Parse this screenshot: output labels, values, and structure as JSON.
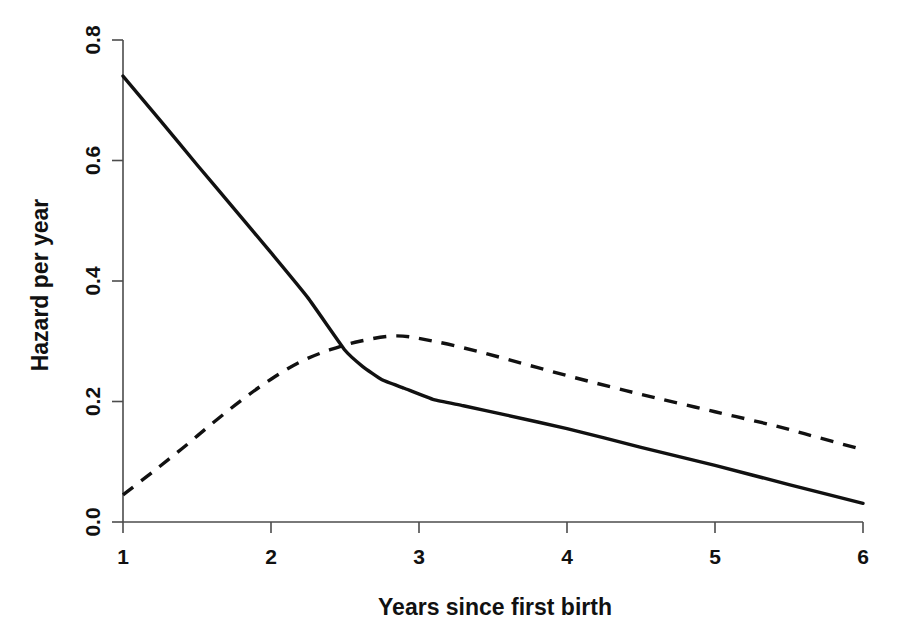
{
  "chart_data": {
    "type": "line",
    "title": "",
    "subtitle": "",
    "xlabel": "Years since first birth",
    "ylabel": "Hazard per year",
    "xlim": [
      1,
      6
    ],
    "ylim": [
      0.0,
      0.8
    ],
    "xticks": [
      "1",
      "2",
      "3",
      "4",
      "5",
      "6"
    ],
    "xtick_values": [
      1,
      2,
      3,
      4,
      5,
      6
    ],
    "yticks": [
      "0.0",
      "0.2",
      "0.4",
      "0.6",
      "0.8"
    ],
    "ytick_values": [
      0.0,
      0.2,
      0.4,
      0.6,
      0.8
    ],
    "grid": false,
    "legend": "none",
    "background_color": "#ffffff",
    "line_color": "#111111",
    "axis_color": "#4c4c4c",
    "series": [
      {
        "name": "solid-curve",
        "style": "solid",
        "x": [
          1.0,
          1.25,
          1.5,
          1.75,
          2.0,
          2.25,
          2.5,
          2.62,
          2.75,
          2.9,
          3.1,
          3.3,
          3.6,
          4.0,
          4.5,
          5.0,
          5.5,
          6.0
        ],
        "values": [
          0.74,
          0.667,
          0.593,
          0.52,
          0.447,
          0.372,
          0.285,
          0.258,
          0.236,
          0.222,
          0.203,
          0.193,
          0.177,
          0.155,
          0.124,
          0.094,
          0.062,
          0.031
        ]
      },
      {
        "name": "dashed-curve",
        "style": "dashed",
        "x": [
          1.0,
          1.2,
          1.4,
          1.6,
          1.8,
          2.0,
          2.2,
          2.4,
          2.6,
          2.85,
          3.1,
          3.4,
          3.7,
          4.0,
          4.3,
          4.6,
          5.0,
          5.4,
          5.7,
          6.0
        ],
        "values": [
          0.045,
          0.083,
          0.122,
          0.163,
          0.202,
          0.237,
          0.266,
          0.286,
          0.3,
          0.309,
          0.3,
          0.283,
          0.263,
          0.243,
          0.224,
          0.206,
          0.183,
          0.16,
          0.14,
          0.12
        ]
      }
    ]
  },
  "axes": {
    "y_title": "Hazard per year",
    "x_title": "Years since first birth"
  }
}
